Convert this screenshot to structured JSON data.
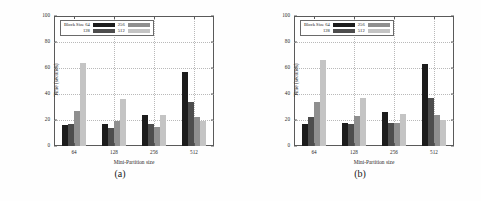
{
  "figure": {
    "background": "#ffffff",
    "panels": [
      {
        "caption": "(a)"
      },
      {
        "caption": "(b)"
      }
    ]
  },
  "series_colors": {
    "block_64": "#1c1c1c",
    "block_128": "#4d4d4d",
    "block_256": "#8f8f8f",
    "block_512": "#c4c4c4"
  },
  "legend": {
    "entries": [
      {
        "label": "Block Size 64",
        "color": "#1c1c1c"
      },
      {
        "label": "256",
        "color": "#8f8f8f"
      },
      {
        "label": "128",
        "color": "#4d4d4d"
      },
      {
        "label": "512",
        "color": "#c4c4c4"
      }
    ]
  },
  "axes": {
    "ylabel": "Time (seconds)",
    "xlabel": "Mini-Partition size",
    "yticks": [
      "0",
      "20",
      "40",
      "60",
      "80",
      "100"
    ],
    "xticks": [
      "64",
      "128",
      "256",
      "512"
    ]
  },
  "chart_data": [
    {
      "type": "bar",
      "title": "(a)",
      "xlabel": "Mini-Partition size",
      "ylabel": "Time (seconds)",
      "categories": [
        "64",
        "128",
        "256",
        "512"
      ],
      "ylim": [
        0,
        100
      ],
      "yticks": [
        0,
        20,
        40,
        60,
        80,
        100
      ],
      "grid": true,
      "legend_position": "upper left",
      "series": [
        {
          "name": "Block Size 64",
          "color": "#1c1c1c",
          "values": [
            16,
            17,
            24,
            57
          ]
        },
        {
          "name": "128",
          "color": "#4d4d4d",
          "values": [
            17,
            14,
            17,
            34
          ]
        },
        {
          "name": "256",
          "color": "#8f8f8f",
          "values": [
            27,
            19,
            15,
            22
          ]
        },
        {
          "name": "512",
          "color": "#c4c4c4",
          "values": [
            64,
            36,
            24,
            19
          ]
        }
      ]
    },
    {
      "type": "bar",
      "title": "(b)",
      "xlabel": "Mini-Partition size",
      "ylabel": "Time (seconds)",
      "categories": [
        "64",
        "128",
        "256",
        "512"
      ],
      "ylim": [
        0,
        100
      ],
      "yticks": [
        0,
        20,
        40,
        60,
        80,
        100
      ],
      "grid": true,
      "legend_position": "upper left",
      "series": [
        {
          "name": "Block Size 64",
          "color": "#1c1c1c",
          "values": [
            17,
            18,
            26,
            63
          ]
        },
        {
          "name": "128",
          "color": "#4d4d4d",
          "values": [
            22,
            17,
            18,
            37
          ]
        },
        {
          "name": "256",
          "color": "#8f8f8f",
          "values": [
            34,
            23,
            18,
            24
          ]
        },
        {
          "name": "512",
          "color": "#c4c4c4",
          "values": [
            66,
            37,
            25,
            20
          ]
        }
      ]
    }
  ]
}
